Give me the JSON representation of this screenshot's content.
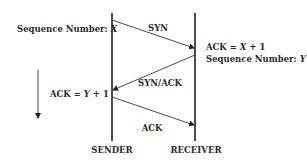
{
  "diagram": {
    "type": "sequence-diagram",
    "colors": {
      "line": "#222222",
      "text": "#2b2b2b",
      "background": "#ffffff"
    },
    "participants": [
      {
        "id": "sender",
        "label": "SENDER"
      },
      {
        "id": "receiver",
        "label": "RECEIVER"
      }
    ],
    "messages": [
      {
        "from": "sender",
        "to": "receiver",
        "label": "SYN"
      },
      {
        "from": "receiver",
        "to": "sender",
        "label": "SYN/ACK"
      },
      {
        "from": "sender",
        "to": "receiver",
        "label": "ACK"
      }
    ],
    "annotations": {
      "sender_seq_prefix": "Sequence Number: ",
      "sender_seq_var": "X",
      "receiver_ack_prefix": "ACK = ",
      "receiver_ack_var": "X",
      "receiver_ack_suffix": " + 1",
      "receiver_seq_prefix": "Sequence Number: ",
      "receiver_seq_var": "Y",
      "sender_ack_prefix": "ACK = ",
      "sender_ack_var": "Y",
      "sender_ack_suffix": " + 1"
    },
    "time_arrow": {
      "direction": "down"
    }
  }
}
